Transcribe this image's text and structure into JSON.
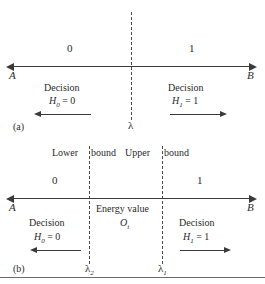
{
  "figure": {
    "panels": [
      {
        "tag": "(a)",
        "axis": {
          "left_endpoint": "A",
          "right_endpoint": "B"
        },
        "region_labels": {
          "left": "0",
          "right": "1"
        },
        "threshold": {
          "symbol": "λ"
        },
        "decisions": [
          {
            "word": "Decision",
            "hypothesis": "H",
            "subscript": "0",
            "equals_value": "= 0",
            "direction": "left"
          },
          {
            "word": "Decision",
            "hypothesis": "H",
            "subscript": "1",
            "equals_value": "= 1",
            "direction": "right"
          }
        ]
      },
      {
        "tag": "(b)",
        "axis": {
          "left_endpoint": "A",
          "right_endpoint": "B"
        },
        "region_labels": {
          "left": "0",
          "right": "1"
        },
        "bounds": [
          {
            "label_before": "Lower",
            "label_after": "bound",
            "symbol": "λ",
            "subscript": "2"
          },
          {
            "label_before": "Upper",
            "label_after": "bound",
            "symbol": "λ",
            "subscript": "1"
          }
        ],
        "middle": {
          "caption": "Energy value",
          "variable": "O",
          "variable_subscript": "i"
        },
        "decisions": [
          {
            "word": "Decision",
            "hypothesis": "H",
            "subscript": "0",
            "equals_value": "= 0",
            "direction": "left"
          },
          {
            "word": "Decision",
            "hypothesis": "H",
            "subscript": "1",
            "equals_value": "= 1",
            "direction": "right"
          }
        ]
      }
    ],
    "colors": {
      "ink": "#3a3a3a",
      "dash": "#4a4a4a",
      "rule": "#6d6d6d"
    }
  }
}
